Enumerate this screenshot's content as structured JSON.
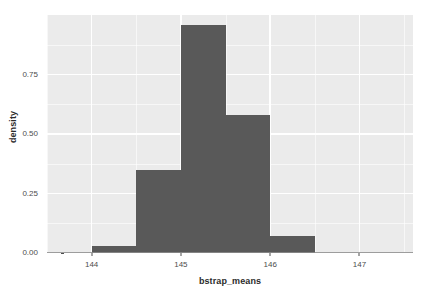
{
  "chart_data": {
    "type": "bar",
    "title": "",
    "subtitle": "",
    "xlabel": "bstrap_means",
    "ylabel": "density",
    "xlim": [
      143.5,
      147.6
    ],
    "ylim": [
      0.0,
      1.0
    ],
    "grid": true,
    "legend": null,
    "bin_width": 0.5,
    "categories": [
      "144.0-144.5",
      "144.5-145.0",
      "145.0-145.5",
      "145.5-146.0",
      "146.0-146.5"
    ],
    "bin_edges": [
      144.0,
      144.5,
      145.0,
      145.5,
      146.0,
      146.5
    ],
    "values": [
      0.03,
      0.35,
      0.96,
      0.58,
      0.07
    ],
    "x_ticks": [
      {
        "value": 144,
        "label": "144"
      },
      {
        "value": 145,
        "label": "145"
      },
      {
        "value": 146,
        "label": "146"
      },
      {
        "value": 147,
        "label": "147"
      }
    ],
    "y_ticks": [
      {
        "value": 0.0,
        "label": "0.00"
      },
      {
        "value": 0.25,
        "label": "0.25"
      },
      {
        "value": 0.5,
        "label": "0.50"
      },
      {
        "value": 0.75,
        "label": "0.75"
      }
    ],
    "x_minor_ticks": [
      143.5,
      144.5,
      145.5,
      146.5,
      147.5
    ],
    "y_minor_ticks": [
      0.125,
      0.375,
      0.625,
      0.875
    ],
    "colors": {
      "bar_fill": "#595959",
      "panel_background": "#ebebeb",
      "grid_line": "#ffffff",
      "axis_text": "#4d4d4d",
      "axis_title": "#2b2b2b",
      "plot_background": "#ffffff"
    }
  }
}
